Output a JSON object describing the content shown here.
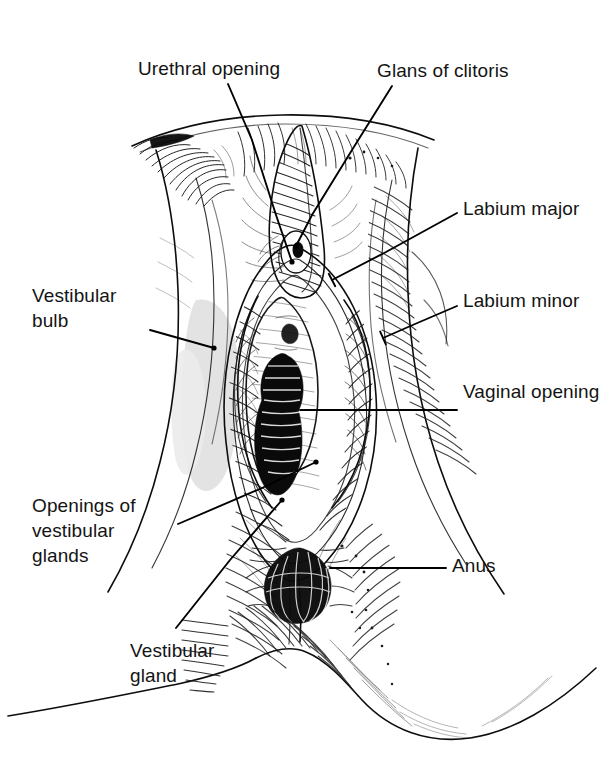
{
  "figure": {
    "kind": "anatomical-line-drawing",
    "style": "black-and-white pen-and-ink hatched medical illustration",
    "background_color": "#ffffff",
    "ink_color": "#111111",
    "tint_color": "#dedede",
    "width": 604,
    "height": 778
  },
  "labels": [
    {
      "id": "urethral-opening",
      "text": "Urethral opening",
      "lines": [
        "Urethral opening"
      ],
      "x": 138,
      "y": 56,
      "align": "left",
      "leader": {
        "points": "228,84 252,140 276,215 292,262",
        "endpoint": "dot"
      }
    },
    {
      "id": "glans-of-clitoris",
      "text": "Glans of clitoris",
      "lines": [
        "Glans of clitoris"
      ],
      "x": 377,
      "y": 58,
      "align": "left",
      "leader": {
        "points": "392,86 352,150 312,215 296,246",
        "endpoint": "dot"
      }
    },
    {
      "id": "labium-major",
      "text": "Labium major",
      "lines": [
        "Labium major"
      ],
      "x": 463,
      "y": 196,
      "align": "left",
      "leader": {
        "points": "457,213 386,252 332,280",
        "endpoint": "tick"
      }
    },
    {
      "id": "labium-minor",
      "text": "Labium minor",
      "lines": [
        "Labium minor"
      ],
      "x": 463,
      "y": 288,
      "align": "left",
      "leader": {
        "points": "457,306 415,324 383,338",
        "endpoint": "tick"
      }
    },
    {
      "id": "vaginal-opening",
      "text": "Vaginal opening",
      "lines": [
        "Vaginal opening"
      ],
      "x": 463,
      "y": 379,
      "align": "left",
      "leader": {
        "points": "457,410 300,410",
        "endpoint": "flat"
      }
    },
    {
      "id": "anus",
      "text": "Anus",
      "lines": [
        "Anus"
      ],
      "x": 452,
      "y": 553,
      "align": "left",
      "leader": {
        "points": "446,568 330,568",
        "endpoint": "flat"
      }
    },
    {
      "id": "vestibular-bulb",
      "text": "Vestibular bulb",
      "lines": [
        "Vestibular",
        "bulb"
      ],
      "x": 32,
      "y": 283,
      "align": "left",
      "leader": {
        "points": "150,330 214,348",
        "endpoint": "dot"
      }
    },
    {
      "id": "openings-of-vestibular-glands",
      "text": "Openings of vestibular glands",
      "lines": [
        "Openings of",
        "vestibular",
        "glands"
      ],
      "x": 32,
      "y": 493,
      "align": "left",
      "leader": {
        "points": "178,524 262,488 316,462",
        "endpoint": "dot"
      }
    },
    {
      "id": "vestibular-gland",
      "text": "Vestibular gland",
      "lines": [
        "Vestibular",
        "gland"
      ],
      "x": 130,
      "y": 638,
      "align": "left",
      "leader": {
        "points": "176,628 230,560 282,500",
        "endpoint": "dot"
      }
    }
  ],
  "regions": [
    {
      "id": "left-thigh",
      "name": "Left thigh and labium major (viewer left)"
    },
    {
      "id": "right-thigh",
      "name": "Right thigh and labium major (viewer right)"
    },
    {
      "id": "mons-pubis",
      "name": "Mons pubis with pubic hair"
    },
    {
      "id": "clitoral-hood",
      "name": "Prepuce / clitoral hood"
    },
    {
      "id": "glans-clitoris",
      "name": "Glans of clitoris"
    },
    {
      "id": "urethral-meatus",
      "name": "Urethral opening"
    },
    {
      "id": "vestibule",
      "name": "Vestibule"
    },
    {
      "id": "vaginal-introitus",
      "name": "Vaginal opening"
    },
    {
      "id": "vestibular-bulb-shading",
      "name": "Vestibular bulb (shaded)"
    },
    {
      "id": "perineum",
      "name": "Perineum"
    },
    {
      "id": "anus-region",
      "name": "Anus"
    },
    {
      "id": "buttocks",
      "name": "Buttocks lower border"
    }
  ]
}
